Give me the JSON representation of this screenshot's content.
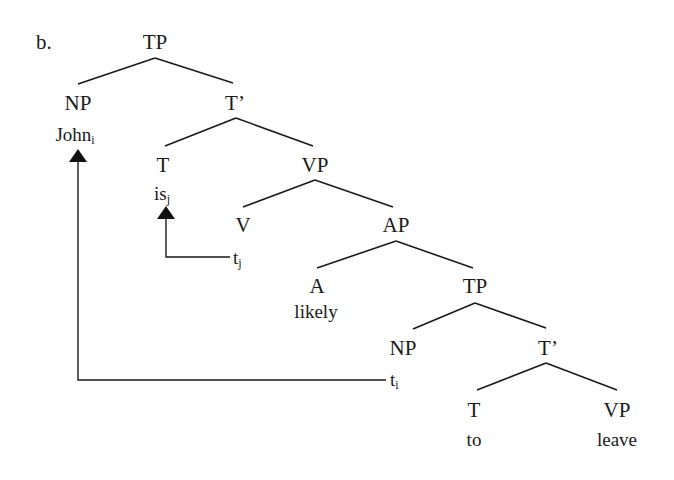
{
  "example_label": "b.",
  "nodes": {
    "tp_root": "TP",
    "np_subject": "NP",
    "john": "John",
    "john_index": "i",
    "tbar_1": "T’",
    "t_1": "T",
    "is": "is",
    "is_index": "j",
    "vp_1": "VP",
    "v": "V",
    "trace_j": "t",
    "trace_j_index": "j",
    "ap": "AP",
    "a": "A",
    "likely": "likely",
    "tp_embedded": "TP",
    "np_embedded": "NP",
    "trace_i": "t",
    "trace_i_index": "i",
    "tbar_2": "T’",
    "t_2": "T",
    "to": "to",
    "vp_2": "VP",
    "leave": "leave"
  },
  "movements": [
    {
      "from": "trace_j",
      "to": "is",
      "index": "j"
    },
    {
      "from": "trace_i",
      "to": "john",
      "index": "i"
    }
  ]
}
